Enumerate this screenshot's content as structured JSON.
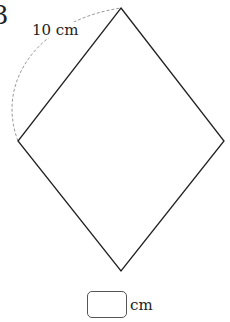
{
  "problem": {
    "number": "3"
  },
  "figure": {
    "shape": "rhombus",
    "vertices": {
      "top": [
        121,
        8
      ],
      "left": [
        18,
        141
      ],
      "right": [
        224,
        141
      ],
      "bottom": [
        121,
        271
      ]
    },
    "side_label": "10 cm",
    "line_color": "#222222",
    "arc_color": "#999999"
  },
  "answer": {
    "value": "",
    "unit": "cm"
  }
}
